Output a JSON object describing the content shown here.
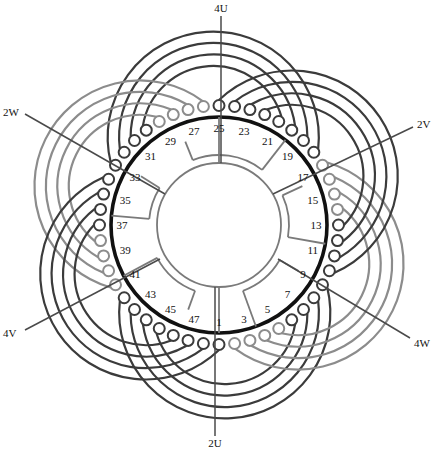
{
  "canvas": {
    "width": 442,
    "height": 452,
    "background": "#ffffff"
  },
  "geometry": {
    "cx": 219,
    "cy": 225,
    "slot_ring_r": 108,
    "slot_label_r": 97,
    "terminal_r": 119.5,
    "terminal_circle_r": 5.5,
    "coil_center_offset": 88,
    "inner_ring_r": 62,
    "jumper_ring_r": 70,
    "slot_count": 48,
    "slot_step_deg": 7.5
  },
  "colors": {
    "slot_ring": "#111111",
    "dark_coil": "#3b3b3b",
    "gray_coil": "#8c8c8c",
    "jumper": "#7a7a7a",
    "lead": "#4a4a4a",
    "text": "#111111"
  },
  "slot_labels": [
    "1",
    "3",
    "5",
    "7",
    "9",
    "11",
    "13",
    "15",
    "17",
    "19",
    "21",
    "23",
    "25",
    "27",
    "29",
    "31",
    "33",
    "35",
    "37",
    "39",
    "41",
    "43",
    "45",
    "47"
  ],
  "leads": [
    {
      "label": "4U",
      "line": [
        221,
        16,
        221,
        163
      ],
      "text_xy": [
        221,
        12
      ],
      "anchor": "middle"
    },
    {
      "label": "2V",
      "line": [
        413,
        127,
        273,
        194
      ],
      "text_xy": [
        417,
        128
      ],
      "anchor": "start"
    },
    {
      "label": "4W",
      "line": [
        410,
        338,
        278,
        259
      ],
      "text_xy": [
        414,
        347
      ],
      "anchor": "start"
    },
    {
      "label": "2U",
      "line": [
        215,
        436,
        215,
        287
      ],
      "text_xy": [
        215,
        447
      ],
      "anchor": "middle"
    },
    {
      "label": "4V",
      "line": [
        25,
        330,
        160,
        259
      ],
      "text_xy": [
        3,
        337
      ],
      "anchor": "start"
    },
    {
      "label": "2W",
      "line": [
        25,
        114,
        165,
        194
      ],
      "text_xy": [
        3,
        116
      ],
      "anchor": "start"
    }
  ],
  "coil_offsets": [
    4.5,
    5.5,
    6.5,
    7.5
  ],
  "coil_groups": [
    {
      "position": "bottom",
      "center_slot": 1.5,
      "color": "dark"
    },
    {
      "position": "lower-right",
      "center_slot": 9.5,
      "color": "gray"
    },
    {
      "position": "upper-right",
      "center_slot": 17.5,
      "color": "dark"
    },
    {
      "position": "top",
      "center_slot": 25.5,
      "color": "dark"
    },
    {
      "position": "upper-left",
      "center_slot": 33.5,
      "color": "gray"
    },
    {
      "position": "lower-left",
      "center_slot": 41.5,
      "color": "dark"
    }
  ],
  "jumpers": {
    "arcs": [
      [
        112,
        52
      ],
      [
        175,
        148
      ],
      [
        208,
        250
      ],
      [
        290,
        330
      ],
      [
        350,
        385
      ]
    ],
    "radials": [
      [
        112,
        70,
        90
      ],
      [
        52,
        70,
        108
      ],
      [
        90,
        62,
        108
      ],
      [
        148,
        70,
        92
      ],
      [
        175,
        70,
        108
      ],
      [
        208,
        70,
        108
      ],
      [
        250,
        70,
        90
      ],
      [
        270,
        62,
        108
      ],
      [
        290,
        70,
        108
      ],
      [
        330,
        70,
        92
      ],
      [
        350,
        70,
        108
      ],
      [
        25,
        70,
        92
      ]
    ]
  }
}
